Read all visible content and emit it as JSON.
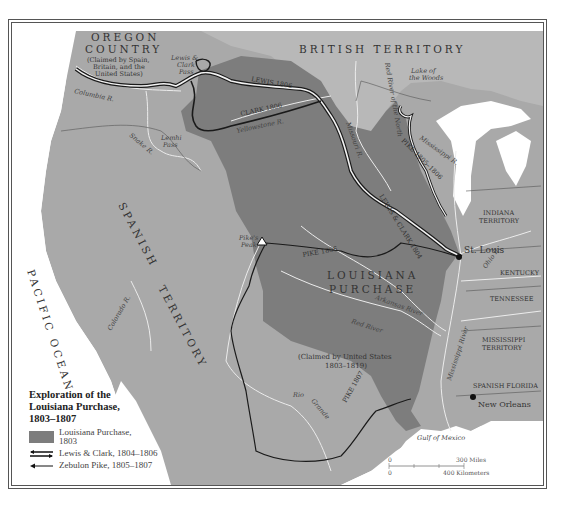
{
  "map": {
    "title": "Exploration of the Louisiana Purchase, 1803–1807",
    "title_lines": [
      "Exploration of the",
      "Louisiana Purchase,",
      "1803–1807"
    ],
    "colors": {
      "louisiana_purchase": "#7d7d7d",
      "other_territory": "#a9a9a9",
      "british_territory": "#b8b8b8",
      "water": "#ffffff",
      "rivers": "#e8e8e8",
      "route": "#1a1a1a"
    },
    "regions": {
      "oregon": [
        "OREGON",
        "COUNTRY",
        "(Claimed by Spain,",
        "Britain, and the",
        "United States)"
      ],
      "british": "BRITISH TERRITORY",
      "spanish_1": "SPANISH",
      "spanish_2": "TERRITORY",
      "louisiana_1": "LOUISIANA",
      "louisiana_2": "PURCHASE",
      "claimed": [
        "(Claimed by United States",
        "1803–1819)"
      ],
      "pacific": "PACIFIC OCEAN",
      "gulf": "Gulf of Mexico",
      "indiana": [
        "INDIANA",
        "TERRITORY"
      ],
      "kentucky": "KENTUCKY",
      "tennessee": "TENNESSEE",
      "mississippi_terr": [
        "MISSISSIPPI",
        "TERRITORY"
      ],
      "spanish_florida": "SPANISH FLORIDA"
    },
    "places": {
      "st_louis": "St. Louis",
      "new_orleans": "New Orleans",
      "pikes_peak": [
        "Pike's",
        "Peak"
      ],
      "lewis_clark_pass": [
        "Lewis &",
        "Clark",
        "Pass"
      ],
      "lemhi_pass": [
        "Lemhi",
        "Pass"
      ],
      "lake_woods": [
        "Lake of",
        "the Woods"
      ]
    },
    "rivers": {
      "columbia": "Columbia R.",
      "snake": "Snake R.",
      "yellowstone": "Yellowstone R.",
      "missouri": "Missouri R.",
      "red_north": "Red River of the North",
      "mississippi_upper": "Mississippi R.",
      "mississippi_lower": "Mississippi River",
      "arkansas": "Arkansas River",
      "red": "Red River",
      "rio_grande_1": "Rio",
      "rio_grande_2": "Grande",
      "colorado": "Colorado R.",
      "ohio": "Ohio R."
    },
    "route_labels": {
      "lewis_1806": "LEWIS 1806",
      "clark_1806": "CLARK 1806",
      "lc_1804": "LEWIS & CLARK 1804",
      "pike_1805": "PIKE 1805–1806",
      "pike_1806": "PIKE 1806",
      "pike_1807": "PIKE 1807"
    },
    "legend": {
      "items": [
        {
          "label_1": "Louisiana Purchase,",
          "label_2": "1803"
        },
        {
          "label": "Lewis & Clark, 1804–1806"
        },
        {
          "label": "Zebulon Pike, 1805–1807"
        }
      ]
    },
    "scale": {
      "zero": "0",
      "miles": "300 Miles",
      "km": "400 Kilometers"
    }
  }
}
